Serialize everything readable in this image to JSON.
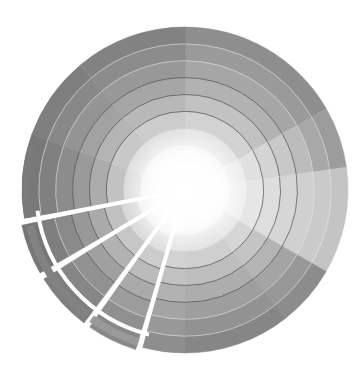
{
  "image": {
    "description": "Grayscale color wheel with concentric rings and segmented sectors; three lower-left sectors are separated with white gaps and outer arc bands",
    "width": 361,
    "height": 388
  },
  "wheel": {
    "center": [
      185,
      190
    ],
    "outer_radius": 163,
    "inner_radius": 28,
    "ring_count": 8,
    "ring_line_color": "#555555",
    "background": "#ffffff",
    "sectors": [
      {
        "start": -90,
        "end": -30,
        "shades": [
          "#f2f2f2",
          "#e4e4e4",
          "#d2d2d2",
          "#c2c2c2",
          "#b2b2b2",
          "#a6a6a6",
          "#9a9a9a",
          "#8e8e8e"
        ]
      },
      {
        "start": -30,
        "end": -8,
        "shades": [
          "#f6f6f6",
          "#ececec",
          "#e0e0e0",
          "#d4d4d4",
          "#c8c8c8",
          "#bcbcbc",
          "#a8a8a8",
          "#9c9c9c"
        ]
      },
      {
        "start": -8,
        "end": 30,
        "shades": [
          "#f8f8f8",
          "#efefef",
          "#e6e6e6",
          "#dedede",
          "#d6d6d6",
          "#d0d0d0",
          "#cacaca",
          "#c4c4c4"
        ]
      },
      {
        "start": 30,
        "end": 52,
        "shades": [
          "#f4f4f4",
          "#e6e6e6",
          "#d6d6d6",
          "#c4c4c4",
          "#b4b4b4",
          "#a4a4a4",
          "#989898",
          "#8c8c8c"
        ]
      },
      {
        "start": 52,
        "end": 90,
        "shades": [
          "#f2f2f2",
          "#e2e2e2",
          "#cfcfcf",
          "#bdbdbd",
          "#adadad",
          "#9e9e9e",
          "#929292",
          "#868686"
        ]
      },
      {
        "start": 90,
        "end": 105,
        "shades": [
          "#f4f4f4",
          "#e4e4e4",
          "#d2d2d2",
          "#c2c2c2",
          "#b2b2b2",
          "#a4a4a4",
          "#989898",
          "#8e8e8e"
        ]
      },
      {
        "start": 107,
        "end": 125,
        "shades": [
          "#f0f0f0",
          "#e0e0e0",
          "#cccccc",
          "#bbbbbb",
          "#aaaaaa",
          "#9c9c9c",
          "#909090",
          "#888888"
        ],
        "exploded": true
      },
      {
        "start": 127,
        "end": 148,
        "shades": [
          "#eeeeee",
          "#dcdcdc",
          "#c6c6c6",
          "#b2b2b2",
          "#a0a0a0",
          "#929292",
          "#868686",
          "#7e7e7e"
        ],
        "exploded": true
      },
      {
        "start": 150,
        "end": 168,
        "shades": [
          "#ececec",
          "#d8d8d8",
          "#c0c0c0",
          "#aaaaaa",
          "#989898",
          "#8a8a8a",
          "#7e7e7e",
          "#767676"
        ],
        "exploded": true
      },
      {
        "start": 170,
        "end": 200,
        "shades": [
          "#eeeeee",
          "#dadada",
          "#c2c2c2",
          "#acacac",
          "#9a9a9a",
          "#8c8c8c",
          "#808080",
          "#787878"
        ]
      },
      {
        "start": 200,
        "end": 230,
        "shades": [
          "#f0f0f0",
          "#dedede",
          "#c8c8c8",
          "#b4b4b4",
          "#a2a2a2",
          "#949494",
          "#888888",
          "#7e7e7e"
        ]
      },
      {
        "start": 230,
        "end": 270,
        "shades": [
          "#f0f0f0",
          "#e0e0e0",
          "#cccccc",
          "#b8b8b8",
          "#a6a6a6",
          "#989898",
          "#8c8c8c",
          "#828282"
        ]
      }
    ],
    "outer_arcs": [
      {
        "start": 170,
        "end": 196,
        "color": "#7a7a7a"
      },
      {
        "start": 128,
        "end": 167,
        "color": "#828282"
      },
      {
        "start": 107,
        "end": 126,
        "color": "#9a9a9a"
      }
    ]
  }
}
